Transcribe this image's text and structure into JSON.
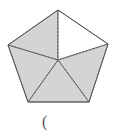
{
  "figure": {
    "shape": "regular-pentagon",
    "vertices": [
      [
        58,
        10
      ],
      [
        108,
        44
      ],
      [
        89,
        102
      ],
      [
        28,
        102
      ],
      [
        8,
        45
      ]
    ],
    "center": [
      58,
      60
    ],
    "sections_total": 5,
    "sections_shaded": 4,
    "unshaded_section": "upper-right",
    "colors": {
      "shade": "#d4d4d4",
      "blank": "#ffffff",
      "stroke": "#666666"
    }
  },
  "answer_blank": "("
}
